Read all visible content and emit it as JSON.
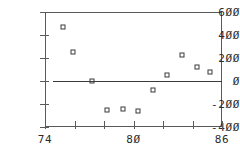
{
  "chart_data": {
    "type": "scatter",
    "title": "",
    "subtitle": "",
    "xlabel": "",
    "ylabel": "",
    "xlim": [
      74,
      86
    ],
    "ylim": [
      -400,
      600
    ],
    "grid": false,
    "legend": null,
    "x_tick_labels": [
      "74",
      "80",
      "86"
    ],
    "x_tick_values": [
      74,
      80,
      86
    ],
    "x_tick_mark_values": [
      74,
      76,
      78,
      80,
      82,
      84,
      86
    ],
    "y_tick_labels": [
      "600",
      "400",
      "200",
      "0",
      "-200",
      "-400"
    ],
    "y_tick_values": [
      600,
      400,
      200,
      0,
      -200,
      -400
    ],
    "x": [
      75.2,
      75.9,
      77.2,
      78.2,
      79.3,
      80.3,
      81.3,
      82.3,
      83.3,
      84.3,
      85.2
    ],
    "y": [
      470,
      255,
      0,
      -250,
      -245,
      -265,
      -80,
      50,
      230,
      120,
      75
    ],
    "annotations": [
      {
        "type": "horizontal-line",
        "value": 0,
        "label": "zero reference line"
      }
    ],
    "marker": "open-square",
    "colors": {
      "axis": "#5a5a5a",
      "marker": "#3a3a3a",
      "reference_line": "#3a3a3a",
      "text": "#2b2b2b",
      "background": "#ffffff"
    }
  }
}
